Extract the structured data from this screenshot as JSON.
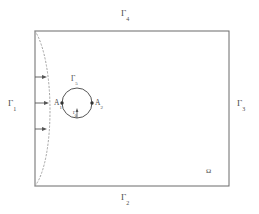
{
  "figure": {
    "title": "",
    "colors": {
      "boundary": "#6b6b6b",
      "circle": "#555555",
      "dotted_profile": "#9a9a9a",
      "arrow": "#555555",
      "text": "#4a4a4a",
      "background": "#ffffff"
    }
  },
  "labels": {
    "gamma1": {
      "base": "Γ",
      "sub": "1"
    },
    "gamma2": {
      "base": "Γ",
      "sub": "2"
    },
    "gamma3": {
      "base": "Γ",
      "sub": "3"
    },
    "gamma4": {
      "base": "Γ",
      "sub": "4"
    },
    "gamma5": {
      "base": "Γ",
      "sub": "5"
    },
    "a1": {
      "base": "A",
      "sub": "1"
    },
    "a2": {
      "base": "A",
      "sub": "2"
    },
    "r0": {
      "base": "r",
      "sub": "0"
    },
    "omega": {
      "base": "Ω"
    }
  },
  "geometry": {
    "domain_rect": {
      "x": 35,
      "y": 31,
      "width": 194,
      "height": 155
    },
    "circle": {
      "cx": 77,
      "cy": 103,
      "r": 15
    },
    "points": [
      {
        "name": "A1",
        "x": 62,
        "y": 103
      },
      {
        "name": "A2",
        "x": 92,
        "y": 103
      }
    ],
    "inflow_arrows": [
      {
        "y": 77,
        "x_start": 35,
        "x_end": 46
      },
      {
        "y": 103,
        "x_start": 35,
        "x_end": 48
      },
      {
        "y": 129,
        "x_start": 35,
        "x_end": 46
      }
    ],
    "profile_curve": "parabolic dotted profile on left boundary, max bulge x=48 at y=103"
  }
}
